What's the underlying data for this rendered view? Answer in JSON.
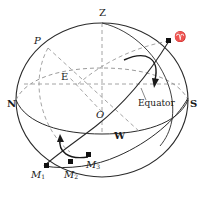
{
  "figure": {
    "type": "astronomy-diagram",
    "background_color": "#ffffff",
    "line_color": "#2a2a2a",
    "dashed_color": "#9a9a9a"
  },
  "labels": {
    "zenith": "Z",
    "pole": "P",
    "aries": "♈",
    "east": "E",
    "center": "O",
    "north": "N",
    "south": "S",
    "west": "W",
    "equator": "Equator",
    "m1": "M",
    "m1_sub": "1",
    "m2": "M",
    "m2_sub": "2",
    "m3": "M",
    "m3_sub": "3"
  },
  "points": [
    {
      "name": "aries-point",
      "x": 169,
      "y": 41
    },
    {
      "name": "m1-point",
      "x": 46,
      "y": 166
    },
    {
      "name": "m2-point",
      "x": 70,
      "y": 162
    },
    {
      "name": "m3-point",
      "x": 89,
      "y": 155
    }
  ],
  "sphere": {
    "cx": 102,
    "cy": 100,
    "rx": 86,
    "ry": 77
  }
}
